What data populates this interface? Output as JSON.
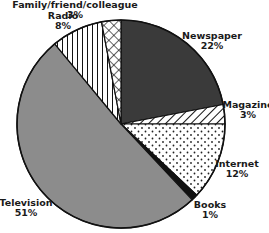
{
  "chart_data": {
    "type": "pie",
    "title": "",
    "start_angle_deg": 0,
    "direction": "clockwise",
    "slices": [
      {
        "label": "Newspaper",
        "value": 22,
        "display": "22%",
        "fill": "#3a3a3a",
        "pattern": "solid-dark"
      },
      {
        "label": "Magazine",
        "value": 3,
        "display": "3%",
        "fill": "#ffffff",
        "pattern": "diagonal-hatch"
      },
      {
        "label": "Internet",
        "value": 12,
        "display": "12%",
        "fill": "#ffffff",
        "pattern": "dots"
      },
      {
        "label": "Books",
        "value": 1,
        "display": "1%",
        "fill": "#111111",
        "pattern": "solid-black"
      },
      {
        "label": "Television",
        "value": 51,
        "display": "51%",
        "fill": "#8c8c8c",
        "pattern": "solid-gray"
      },
      {
        "label": "Radio",
        "value": 8,
        "display": "8%",
        "fill": "#ffffff",
        "pattern": "vertical-lines"
      },
      {
        "label": "Family/friend/colleague",
        "value": 3,
        "display": "3%",
        "fill": "#ffffff",
        "pattern": "crosshatch"
      }
    ]
  },
  "labels": {
    "newspaper": {
      "name": "Newspaper",
      "pct": "22%"
    },
    "magazine": {
      "name": "Magazine",
      "pct": "3%"
    },
    "internet": {
      "name": "Internet",
      "pct": "12%"
    },
    "books": {
      "name": "Books",
      "pct": "1%"
    },
    "television": {
      "name": "Television",
      "pct": "51%"
    },
    "radio": {
      "name": "Radio",
      "pct": "8%"
    },
    "family": {
      "name": "Family/friend/colleague",
      "pct": "3%"
    }
  }
}
